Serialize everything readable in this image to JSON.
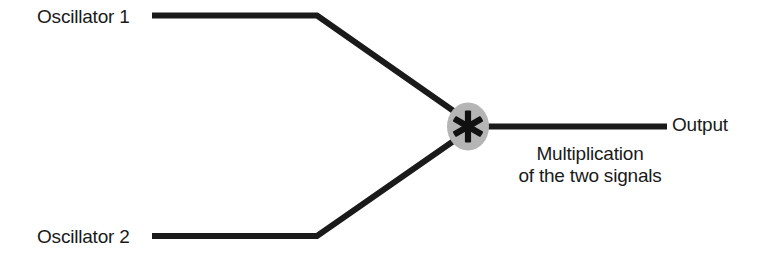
{
  "diagram": {
    "background_color": "#ffffff",
    "line_color": "#1a1a1a",
    "node_fill_color": "#b5b5b5",
    "text_color": "#1a1a1a",
    "inputs": [
      {
        "label": "Oscillator 1"
      },
      {
        "label": "Oscillator 2"
      }
    ],
    "node": {
      "operator_symbol": "✱",
      "operator_name": "multiplication-asterisk"
    },
    "output": {
      "label": "Output"
    },
    "caption": {
      "line1": "Multiplication",
      "line2": "of the two signals"
    }
  }
}
